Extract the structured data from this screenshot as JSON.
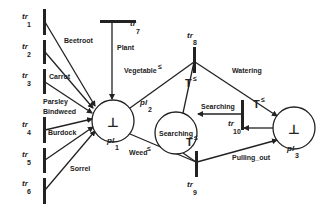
{
  "diagram": {
    "type": "petri-net",
    "colors": {
      "ink": "#222222",
      "background": "#ffffff"
    },
    "places": [
      {
        "id": "pl1",
        "label": "pl",
        "sub": "1",
        "token": "⊥"
      },
      {
        "id": "pl2",
        "label": "pl",
        "sub": "2",
        "token": "Searching"
      },
      {
        "id": "pl3",
        "label": "pl",
        "sub": "3",
        "token": "⊥"
      }
    ],
    "transitions": [
      {
        "id": "tr1",
        "label": "tr",
        "sub": "1"
      },
      {
        "id": "tr2",
        "label": "tr",
        "sub": "2"
      },
      {
        "id": "tr3",
        "label": "tr",
        "sub": "3"
      },
      {
        "id": "tr4",
        "label": "tr",
        "sub": "4"
      },
      {
        "id": "tr5",
        "label": "tr",
        "sub": "5"
      },
      {
        "id": "tr6",
        "label": "tr",
        "sub": "6"
      },
      {
        "id": "tr7",
        "label": "tr",
        "sub": "7"
      },
      {
        "id": "tr8",
        "label": "tr",
        "sub": "8"
      },
      {
        "id": "tr9",
        "label": "tr",
        "sub": "9"
      },
      {
        "id": "tr10",
        "label": "tr",
        "sub": "10"
      }
    ],
    "arc_labels": {
      "beetroot": "Beetroot",
      "carrot": "Carrot",
      "parsley": "Parsley",
      "bindweed": "Bindweed",
      "burdock": "Burdock",
      "sorrel": "Sorrel",
      "plant": "Plant",
      "vegetable": "Vegetable",
      "vegetable_sup": "≤",
      "weed": "Weed",
      "weed_sup": "≤",
      "watering": "Watering",
      "searching": "Searching",
      "pulling_out": "Pulling_out",
      "t_top": "T",
      "t_top_sup": "≤",
      "t_bottom": "T",
      "t_bottom_sup": "≤",
      "t_right": "T",
      "t_right_sup": "≤"
    }
  }
}
